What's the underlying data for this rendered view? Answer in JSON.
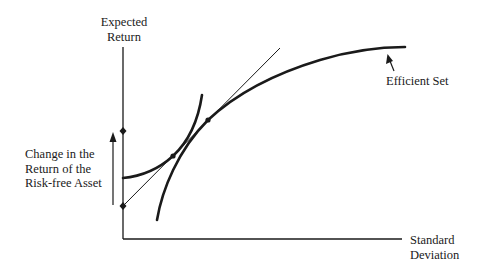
{
  "labels": {
    "y_axis": [
      "Expected",
      "Return"
    ],
    "x_axis": [
      "Standard",
      "Deviation"
    ],
    "efficient_set": "Efficient Set",
    "risk_free_change": [
      "Change in the",
      "Return of the",
      "Risk-free Asset"
    ]
  },
  "elements": {
    "y_axis": "Expected Return (vertical axis)",
    "x_axis": "Standard Deviation (horizontal axis)",
    "efficient_set_curve": "concave efficient frontier",
    "indifference_curve": "convex indifference curve",
    "capital_market_line": "tangent line from risk-free rate",
    "risk_free_rate_old": "lower marker on vertical axis",
    "risk_free_rate_new": "upper marker on vertical axis",
    "tangency_points": 2
  },
  "colors": {
    "line": "#1a1a1a",
    "background": "#ffffff"
  }
}
